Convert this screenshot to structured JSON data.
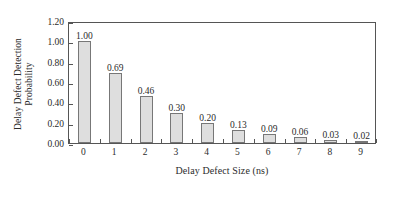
{
  "chart_data": {
    "type": "bar",
    "title": "",
    "subtitle": "",
    "xlabel": "Delay Defect Size (ns)",
    "ylabel": "Delay Defect Detection Probability",
    "ylabel_lines": [
      "Delay Defect Detection",
      "Probability"
    ],
    "categories": [
      "0",
      "1",
      "2",
      "3",
      "4",
      "5",
      "6",
      "7",
      "8",
      "9"
    ],
    "values": [
      1.0,
      0.69,
      0.46,
      0.3,
      0.2,
      0.13,
      0.09,
      0.06,
      0.03,
      0.02
    ],
    "value_labels": [
      "1.00",
      "0.69",
      "0.46",
      "0.30",
      "0.20",
      "0.13",
      "0.09",
      "0.06",
      "0.03",
      "0.02"
    ],
    "ylim": [
      0.0,
      1.2
    ],
    "ytick_values": [
      0.0,
      0.2,
      0.4,
      0.6,
      0.8,
      1.0,
      1.2
    ],
    "ytick_labels": [
      "0.00",
      "0.20",
      "0.40",
      "0.60",
      "0.80",
      "1.00",
      "1.20"
    ],
    "grid": false,
    "legend": null,
    "legend_position": "none",
    "bar_fill_color": "#dedede",
    "bar_edge_color": "#777777",
    "axis_color": "#555555",
    "text_color": "#2b2b2b",
    "background_color": "#ffffff",
    "show_value_labels": true,
    "tick_direction": "in"
  }
}
